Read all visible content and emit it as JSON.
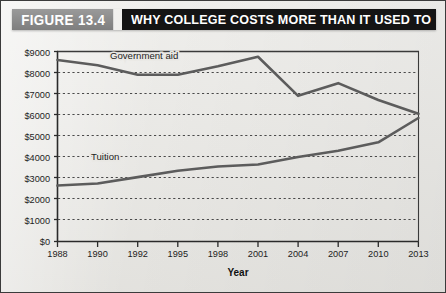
{
  "figure": {
    "number_label": "FIGURE 13.4",
    "title": "WHY COLLEGE COSTS MORE THAN IT USED TO",
    "number_box_color": "#8a8a8a",
    "title_box_color": "#141414",
    "title_text_color": "#ffffff",
    "background_color": "#e9e8e4"
  },
  "chart_data": {
    "type": "line",
    "title": "WHY COLLEGE COSTS MORE THAN IT USED TO",
    "subtitle": "",
    "xlabel": "Year",
    "ylabel": "",
    "x": [
      1988,
      1990,
      1992,
      1995,
      1998,
      2001,
      2004,
      2007,
      2010,
      2013
    ],
    "categories": [
      "1988",
      "1990",
      "1992",
      "1995",
      "1998",
      "2001",
      "2004",
      "2007",
      "2010",
      "2013"
    ],
    "xlim": [
      1988,
      2013
    ],
    "ylim": [
      0,
      9000
    ],
    "ytick_values": [
      0,
      1000,
      2000,
      3000,
      4000,
      5000,
      6000,
      7000,
      8000,
      9000
    ],
    "ytick_labels": [
      "$0",
      "$1000",
      "$2000",
      "$3000",
      "$4000",
      "$5000",
      "$6000",
      "$7000",
      "$8000",
      "$9000"
    ],
    "grid": true,
    "grid_style": "dotted-horizontal",
    "legend": "inline-labels",
    "legend_position": "on-plot",
    "series": [
      {
        "name": "Government aid",
        "label": "Government aid",
        "color": "#5c5c5c",
        "values": [
          8600,
          8350,
          7900,
          7900,
          8300,
          8750,
          6900,
          7500,
          6700,
          6050
        ]
      },
      {
        "name": "Tuition",
        "label": "Tuition",
        "color": "#5c5c5c",
        "values": [
          2650,
          2750,
          3050,
          3350,
          3550,
          3650,
          4000,
          4300,
          4700,
          5850
        ]
      }
    ],
    "annotations": [
      {
        "text": "Government aid",
        "x": 1994,
        "y": 8450
      },
      {
        "text": "Tuition",
        "x": 1991.3,
        "y": 3650
      }
    ]
  },
  "axis": {
    "x_title": "Year",
    "y_ticks": [
      "$9000",
      "$8000",
      "$7000",
      "$6000",
      "$5000",
      "$4000",
      "$3000",
      "$2000",
      "$1000",
      "$0"
    ],
    "x_ticks": [
      "1988",
      "1990",
      "1992",
      "1995",
      "1998",
      "2001",
      "2004",
      "2007",
      "2010",
      "2013"
    ]
  }
}
